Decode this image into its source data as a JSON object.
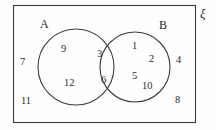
{
  "diagram": {
    "type": "venn-2-set",
    "universe_label": "ξ",
    "set_a_label": "A",
    "set_b_label": "B",
    "stroke_color": "#3a3a3a",
    "text_color": "#2b2b2b",
    "background_color": "#fefefe",
    "regions": {
      "a_only": [
        9,
        12
      ],
      "intersection": [
        3,
        6
      ],
      "b_only": [
        1,
        2,
        5,
        10
      ],
      "outside": [
        7,
        11,
        4,
        8
      ]
    },
    "elements": [
      {
        "name": "a-only-9",
        "text": "9",
        "x": 61,
        "y": 44
      },
      {
        "name": "a-only-12",
        "text": "12",
        "x": 64,
        "y": 78
      },
      {
        "name": "intersection-3",
        "text": "3",
        "x": 97,
        "y": 49
      },
      {
        "name": "intersection-6",
        "text": "6",
        "x": 101,
        "y": 75
      },
      {
        "name": "b-only-1",
        "text": "1",
        "x": 132,
        "y": 41
      },
      {
        "name": "b-only-2",
        "text": "2",
        "x": 149,
        "y": 54
      },
      {
        "name": "b-only-5",
        "text": "5",
        "x": 132,
        "y": 71
      },
      {
        "name": "b-only-10",
        "text": "10",
        "x": 142,
        "y": 81
      },
      {
        "name": "outside-7",
        "text": "7",
        "x": 20,
        "y": 57
      },
      {
        "name": "outside-11",
        "text": "11",
        "x": 21,
        "y": 96
      },
      {
        "name": "outside-4",
        "text": "4",
        "x": 176,
        "y": 55
      },
      {
        "name": "outside-8",
        "text": "8",
        "x": 175,
        "y": 95
      }
    ],
    "shapes": {
      "rect": {
        "x": 13.5,
        "y": 5.5,
        "width": 182,
        "height": 117
      },
      "circle_a": {
        "cx": 76,
        "cy": 67,
        "r": 38
      },
      "circle_b": {
        "cx": 135,
        "cy": 67,
        "r": 35
      }
    },
    "labels": {
      "a": {
        "x": 40,
        "y": 18
      },
      "b": {
        "x": 159,
        "y": 19
      },
      "universe": {
        "x": 200,
        "y": 7
      }
    }
  }
}
